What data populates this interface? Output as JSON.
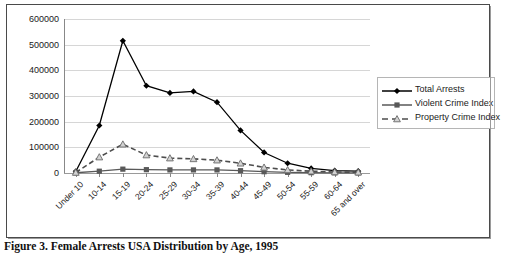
{
  "caption": "Figure 3. Female Arrests USA Distribution by Age, 1995",
  "legend": {
    "items": [
      {
        "label": "Total Arrests",
        "marker": "diamond-marker",
        "dash": false,
        "color": "#000000"
      },
      {
        "label": "Violent Crime Index",
        "marker": "square-marker",
        "dash": false,
        "color": "#595959"
      },
      {
        "label": "Property Crime Index",
        "marker": "triangle-marker",
        "dash": true,
        "color": "#4d4d4d"
      }
    ]
  },
  "chart_data": {
    "type": "line",
    "title": "",
    "xlabel": "",
    "ylabel": "",
    "ylim": [
      0,
      600000
    ],
    "ytick_values": [
      0,
      100000,
      200000,
      300000,
      400000,
      500000,
      600000
    ],
    "ytick_labels": [
      "0",
      "100000",
      "200000",
      "300000",
      "400000",
      "500000",
      "600000"
    ],
    "grid": true,
    "legend_position": "right",
    "categories": [
      "Under 10",
      "10-14",
      "15-19",
      "20-24",
      "25-29",
      "30-34",
      "35-39",
      "40-44",
      "45-49",
      "50-54",
      "55-59",
      "60-64",
      "65 and over"
    ],
    "series": [
      {
        "name": "Total Arrests",
        "marker": "diamond",
        "dash": false,
        "color": "#000000",
        "values": [
          6000,
          185000,
          515000,
          340000,
          312000,
          318000,
          276000,
          166000,
          80000,
          38000,
          18000,
          9000,
          7000
        ]
      },
      {
        "name": "Violent Crime Index",
        "marker": "square",
        "dash": false,
        "color": "#595959",
        "values": [
          1000,
          7000,
          15000,
          13000,
          12000,
          12000,
          12000,
          9000,
          5000,
          2500,
          1200,
          600,
          500
        ]
      },
      {
        "name": "Property Crime Index",
        "marker": "triangle",
        "dash": true,
        "color": "#4d4d4d",
        "values": [
          2000,
          62000,
          112000,
          70000,
          58000,
          55000,
          50000,
          38000,
          22000,
          12000,
          7000,
          4000,
          3000
        ]
      }
    ]
  }
}
